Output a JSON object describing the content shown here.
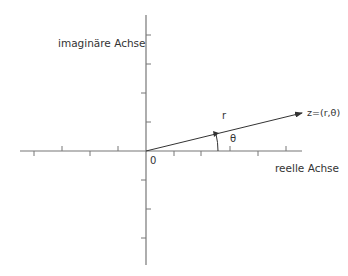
{
  "diagram": {
    "labels": {
      "imag_axis": "imaginäre Achse",
      "real_axis": "reelle Achse",
      "origin": "0",
      "radius": "r",
      "angle": "θ",
      "point": "z=(r,θ)"
    },
    "colors": {
      "axis": "#777777",
      "vector": "#333333",
      "text": "#333333"
    },
    "origin": [
      146,
      151
    ],
    "vector_end": [
      302,
      113
    ]
  }
}
